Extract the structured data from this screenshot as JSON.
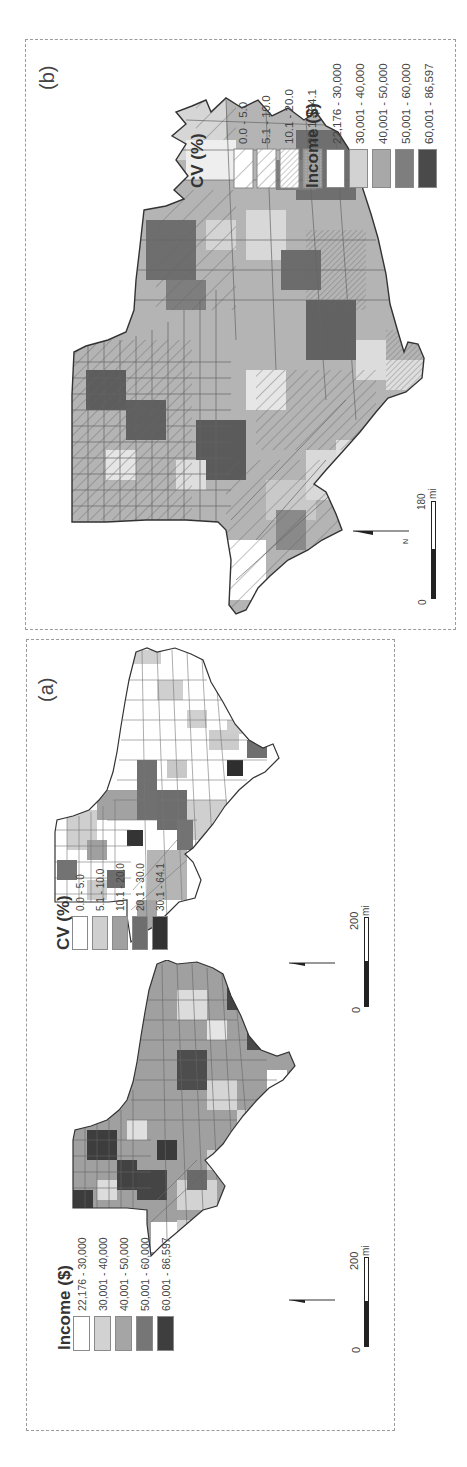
{
  "figure": {
    "panels": [
      {
        "id": "b",
        "label": "(b)",
        "legend_cv": {
          "title": "CV (%)",
          "items": [
            {
              "label": "0.0 - 5.0",
              "pattern": "sparse-hatch"
            },
            {
              "label": "5.1 - 10.0",
              "pattern": "medium-hatch"
            },
            {
              "label": "10.1 - 20.0",
              "pattern": "dense-hatch"
            },
            {
              "label": "20.1 - 64.1",
              "pattern": "stipple"
            }
          ]
        },
        "legend_income": {
          "title": "Income ($)",
          "items": [
            {
              "label": "22,176 - 30,000",
              "color": "#ffffff"
            },
            {
              "label": "30,001 - 40,000",
              "color": "#d2d2d2"
            },
            {
              "label": "40,001 - 50,000",
              "color": "#a8a8a8"
            },
            {
              "label": "50,001 - 60,000",
              "color": "#7e7e7e"
            },
            {
              "label": "60,001 - 86,597",
              "color": "#4a4a4a"
            }
          ]
        },
        "scale": {
          "start": "0",
          "end": "180",
          "unit": "mi"
        },
        "north_label": "N"
      },
      {
        "id": "a",
        "label": "(a)",
        "legend_cv": {
          "title": "CV (%)",
          "items": [
            {
              "label": "0.0 - 5.0",
              "color": "#ffffff"
            },
            {
              "label": "5.1 - 10.0",
              "color": "#cfcfcf"
            },
            {
              "label": "10.1 - 20.0",
              "color": "#a0a0a0"
            },
            {
              "label": "20.1 - 30.0",
              "color": "#6e6e6e"
            },
            {
              "label": "30.1 - 64.1",
              "color": "#333333"
            }
          ]
        },
        "legend_income": {
          "title": "Income ($)",
          "items": [
            {
              "label": "22,176 - 30,000",
              "color": "#ffffff"
            },
            {
              "label": "30,001 - 40,000",
              "color": "#d2d2d2"
            },
            {
              "label": "40,001 - 50,000",
              "color": "#a5a5a5"
            },
            {
              "label": "50,001 - 60,000",
              "color": "#767676"
            },
            {
              "label": "60,001 - 86,597",
              "color": "#3e3e3e"
            }
          ]
        },
        "scale_cv": {
          "start": "0",
          "end": "200",
          "unit": "mi"
        },
        "scale_income": {
          "start": "0",
          "end": "200",
          "unit": "mi"
        },
        "north_label": "N"
      }
    ]
  }
}
